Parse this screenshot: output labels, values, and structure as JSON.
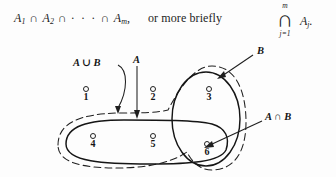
{
  "formula": {
    "left": {
      "term1": "A",
      "sub1": "1",
      "op1": "∩",
      "term2": "A",
      "sub2": "2",
      "op2": "∩",
      "dots": "· · ·",
      "op3": "∩",
      "term3": "A",
      "sub3": "m",
      "comma": ","
    },
    "middle_text": "or more briefly",
    "right": {
      "upper_index": "m",
      "big_operator": "∩",
      "lower_index": "j=1",
      "term": "A",
      "term_sub": "j",
      "trailing": "."
    }
  },
  "diagram": {
    "type": "venn-diagram",
    "caption_labels": {
      "a_union_b": "A ∪ B",
      "a": "A",
      "b": "B",
      "a_intersect_b": "A ∩ B"
    },
    "points": [
      {
        "id": "point-1",
        "label": "1",
        "region": "outside all sets"
      },
      {
        "id": "point-2",
        "label": "2",
        "region": "outside all sets"
      },
      {
        "id": "point-3",
        "label": "3",
        "region": "B only"
      },
      {
        "id": "point-4",
        "label": "4",
        "region": "A only"
      },
      {
        "id": "point-5",
        "label": "5",
        "region": "A only"
      },
      {
        "id": "point-6",
        "label": "6",
        "region": "A intersect B"
      }
    ],
    "colors": {
      "stroke": "#1a1a1a",
      "background": "#fdfdfd"
    },
    "strokes": {
      "set_a": "solid",
      "set_b": "solid",
      "a_union_b": "dashed"
    }
  }
}
